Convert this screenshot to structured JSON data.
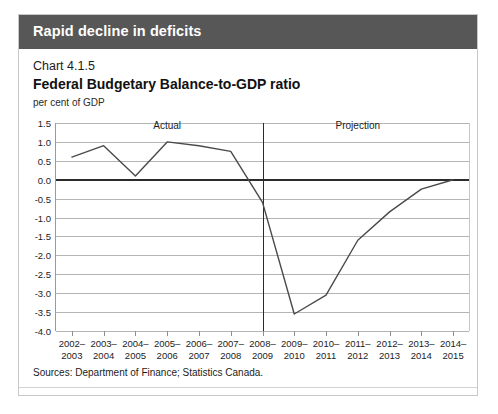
{
  "header": {
    "title": "Rapid decline in deficits",
    "bar_color": "#575757"
  },
  "chart_number": "Chart 4.1.5",
  "chart_title": "Federal Budgetary Balance-to-GDP ratio",
  "units_label": "per cent of GDP",
  "sources": "Sources: Department of Finance; Statistics Canada.",
  "annotations": {
    "actual_label": "Actual",
    "projection_label": "Projection",
    "divider_category": "2008–\n2009"
  },
  "chart_data": {
    "type": "line",
    "title": "Federal Budgetary Balance-to-GDP ratio",
    "subtitle": "Chart 4.1.5",
    "xlabel": "",
    "ylabel": "per cent of GDP",
    "ylim": [
      -4.0,
      1.5
    ],
    "ytick_labels": [
      "1.5",
      "1.0",
      "0.5",
      "0.0",
      "-0.5",
      "-1.0",
      "-1.5",
      "-2.0",
      "-2.5",
      "-3.0",
      "-3.5",
      "-4.0"
    ],
    "yticks": [
      1.5,
      1.0,
      0.5,
      0.0,
      -0.5,
      -1.0,
      -1.5,
      -2.0,
      -2.5,
      -3.0,
      -3.5,
      -4.0
    ],
    "zero_line": 0.0,
    "grid": true,
    "legend": "none",
    "categories": [
      "2002–\n2003",
      "2003–\n2004",
      "2004–\n2005",
      "2005–\n2006",
      "2006–\n2007",
      "2007–\n2008",
      "2008–\n2009",
      "2009–\n2010",
      "2010–\n2011",
      "2011–\n2012",
      "2012–\n2013",
      "2013–\n2014",
      "2014–\n2015"
    ],
    "values": [
      0.6,
      0.9,
      0.1,
      1.0,
      0.9,
      0.75,
      -0.6,
      -3.55,
      -3.05,
      -1.6,
      -0.85,
      -0.25,
      0.0
    ],
    "series_color": "#4a4a4a",
    "divider_index": 6,
    "regions": [
      {
        "label": "Actual",
        "from_index": 0,
        "to_index": 6
      },
      {
        "label": "Projection",
        "from_index": 6,
        "to_index": 12
      }
    ]
  }
}
